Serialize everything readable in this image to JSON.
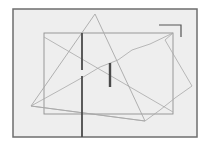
{
  "diagram": {
    "width": 206,
    "height": 152,
    "background": "#ffffff",
    "frame": {
      "x": 13,
      "y": 9,
      "w": 184,
      "h": 128,
      "fill": "#eeeeee",
      "stroke": "#6e6e6e",
      "stroke_width": 1.5
    },
    "colors": {
      "thin_line": "#a8a8a8",
      "rect_line": "#8f8f8f",
      "thick_bar": "#4a4a4a",
      "bracket": "#555555"
    },
    "rectangle": {
      "x": 44,
      "y": 33,
      "w": 129,
      "h": 81
    },
    "triangle": {
      "points": "95,14 31,106 145,121"
    },
    "wavy_quad": {
      "points": "31,106 60,90 85,76 100,67 118,60 132,50 150,44 173,33 165,40 192,86 175,98 160,110 145,121"
    },
    "diagonal": {
      "x1": 44,
      "y1": 37,
      "x2": 173,
      "y2": 112
    },
    "long_bar": {
      "x": 82,
      "y1": 33,
      "y2": 137,
      "gap_start": 70,
      "gap_end": 76
    },
    "short_bar": {
      "x": 110,
      "y1": 63,
      "y2": 87
    },
    "corner_bracket": {
      "points": "159,25 181,25 181,37"
    }
  }
}
